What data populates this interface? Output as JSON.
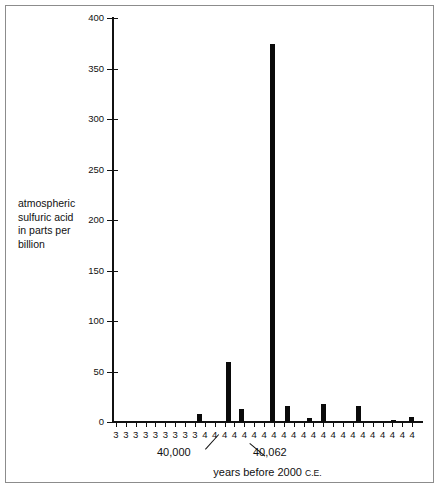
{
  "chart_data": {
    "type": "bar",
    "title": "",
    "subtitle": "",
    "xlabel": "years before 2000 C.E.",
    "ylabel": "atmospheric sulfuric acid in parts per billion",
    "ylabel_lines": [
      "atmospheric",
      "sulfuric acid",
      "in parts per",
      "billion"
    ],
    "ylim": [
      0,
      400
    ],
    "ytick_values": [
      0,
      50,
      100,
      150,
      200,
      250,
      300,
      350,
      400
    ],
    "ytick_labels": [
      "0",
      "50",
      "100",
      "150",
      "200",
      "250",
      "300",
      "350",
      "400"
    ],
    "grid": false,
    "legend": null,
    "bar_color": "#0a0a0a",
    "axis_color": "#111111",
    "frame_color": "#8c8c8c",
    "background": "#ffffff",
    "xtick_labels": [
      "3",
      "3",
      "3",
      "3",
      "3",
      "3",
      "3",
      "3",
      "3",
      "4",
      "4",
      "4",
      "4",
      "4",
      "4",
      "4",
      "4",
      "4",
      "4",
      "4",
      "4",
      "4",
      "4",
      "4",
      "4",
      "4",
      "4",
      "4",
      "4",
      "4",
      "4"
    ],
    "x_tick_count": 31,
    "annotations": [
      {
        "name": "callout-40000",
        "text": "40,000",
        "points_to_tick_index": 9
      },
      {
        "name": "callout-40062",
        "text": "40,062",
        "points_to_tick_index": 15
      }
    ],
    "categories": [
      "39990",
      "39991",
      "39992",
      "39993",
      "39994",
      "39995",
      "39996",
      "39997",
      "39998",
      "39999",
      "40000",
      "40001",
      "40002",
      "40003",
      "40004",
      "40005",
      "40006",
      "40007",
      "40008",
      "40009",
      "40010",
      "40011",
      "40012",
      "40013",
      "40014",
      "40015",
      "40016",
      "40017",
      "40018",
      "40019",
      "40020",
      "40021",
      "40022",
      "40023",
      "40024",
      "40025",
      "40026",
      "40027",
      "40028",
      "40029",
      "40030",
      "40031",
      "40032",
      "40033",
      "40034",
      "40035",
      "40036",
      "40037",
      "40038",
      "40039",
      "40040",
      "40041",
      "40042",
      "40043",
      "40044",
      "40045",
      "40046",
      "40047",
      "40048",
      "40049",
      "40050",
      "40051",
      "40052",
      "40053",
      "40054",
      "40055",
      "40056",
      "40057",
      "40058",
      "40059",
      "40060",
      "40061"
    ],
    "values": [
      0,
      0,
      0,
      0,
      0,
      0,
      0,
      0,
      0,
      0,
      0,
      0,
      0,
      0,
      0,
      0,
      0,
      0,
      8,
      0,
      0,
      0,
      0,
      0,
      59,
      0,
      0,
      13,
      0,
      0,
      0,
      0,
      0,
      0,
      0,
      374,
      0,
      0,
      16,
      0,
      0,
      0,
      4,
      0,
      0,
      18,
      0,
      0,
      0,
      0,
      0,
      0,
      0,
      16,
      0,
      0,
      0,
      0,
      0,
      0,
      0,
      0,
      0,
      0,
      0,
      2,
      0,
      0,
      0,
      0,
      0,
      5
    ],
    "bars": [
      {
        "name": "bar-1",
        "x_px": 84,
        "value": 8
      },
      {
        "name": "bar-2",
        "x_px": 113,
        "value": 59
      },
      {
        "name": "bar-3",
        "x_px": 126,
        "value": 13
      },
      {
        "name": "bar-4",
        "x_px": 157,
        "value": 374
      },
      {
        "name": "bar-5",
        "x_px": 172,
        "value": 16
      },
      {
        "name": "bar-6",
        "x_px": 194,
        "value": 4
      },
      {
        "name": "bar-7",
        "x_px": 208,
        "value": 18
      },
      {
        "name": "bar-8",
        "x_px": 243,
        "value": 16
      },
      {
        "name": "bar-9",
        "x_px": 278,
        "value": 2
      },
      {
        "name": "bar-10",
        "x_px": 296,
        "value": 5
      }
    ]
  }
}
